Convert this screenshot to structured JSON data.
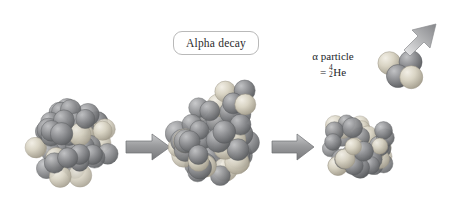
{
  "figure": {
    "type": "diagram",
    "background_color": "#ffffff",
    "width": 455,
    "height": 211
  },
  "labels": {
    "alpha_decay": "Alpha decay",
    "alpha_particle_line1": "α particle",
    "alpha_particle_equals": "=",
    "alpha_particle_mass_number": "4",
    "alpha_particle_atomic_number": "2",
    "alpha_particle_element": "He"
  },
  "colors": {
    "nucleon_dark": "#8e8f91",
    "nucleon_dark_shade": "#5f6164",
    "nucleon_light": "#d8d3c3",
    "nucleon_light_shade": "#a9a393",
    "arrow_fill": "#9b9c9e",
    "arrow_edge": "#6f7072",
    "label_border": "#b9b9b9",
    "text": "#23252b"
  },
  "stages": [
    {
      "name": "parent-nucleus",
      "cx": 72,
      "cy": 143,
      "radius": 48,
      "nucleon_count": 58,
      "caption": null
    },
    {
      "name": "nucleus-with-emerging-alpha",
      "cx": 213,
      "cy": 140,
      "radius": 50,
      "nucleon_count": 58,
      "caption": null
    },
    {
      "name": "daughter-nucleus",
      "cx": 358,
      "cy": 148,
      "radius": 42,
      "nucleon_count": 48,
      "caption": null
    }
  ],
  "arrows": [
    {
      "name": "arrow-stage1-to-stage2",
      "x1": 126,
      "y1": 147,
      "x2": 170,
      "y2": 147,
      "direction": "right"
    },
    {
      "name": "arrow-stage2-to-stage3",
      "x1": 272,
      "y1": 147,
      "x2": 314,
      "y2": 147,
      "direction": "right"
    }
  ],
  "emitted_particle": {
    "name": "alpha-particle",
    "cx": 400,
    "cy": 68,
    "nucleon_count": 4,
    "arrow": {
      "name": "emission-arrow",
      "x1": 410,
      "y1": 44,
      "x2": 446,
      "y2": 8,
      "direction": "up-right",
      "angle_deg": 45
    }
  }
}
